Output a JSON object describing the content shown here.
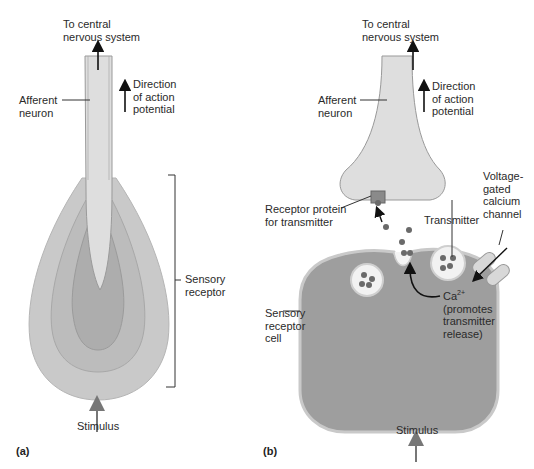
{
  "panel_a": {
    "panel_label": "(a)",
    "to_cns": [
      "To central",
      "nervous system"
    ],
    "afferent": [
      "Afferent",
      "neuron"
    ],
    "direction": [
      "Direction",
      "of action",
      "potential"
    ],
    "sensory_receptor": [
      "Sensory",
      "receptor"
    ],
    "stimulus": "Stimulus"
  },
  "panel_b": {
    "panel_label": "(b)",
    "to_cns": [
      "To central",
      "nervous system"
    ],
    "afferent": [
      "Afferent",
      "neuron"
    ],
    "direction": [
      "Direction",
      "of action",
      "potential"
    ],
    "receptor_protein": [
      "Receptor protein",
      "for transmitter"
    ],
    "voltage_gated": [
      "Voltage-",
      "gated",
      "calcium",
      "channel"
    ],
    "transmitter": "Transmitter",
    "ca_ion": "Ca",
    "ca_charge": "2+",
    "ca_note": [
      "(promotes",
      "transmitter",
      "release)"
    ],
    "sensory_cell": [
      "Sensory",
      "receptor",
      "cell"
    ],
    "stimulus": "Stimulus"
  },
  "colors": {
    "neuron_fill": "#dcdcdc",
    "neuron_edge": "#9a9a9a",
    "layer_outer": "#c8c8c8",
    "layer_mid": "#b9b9b9",
    "layer_inner": "#ababab",
    "cell_fill": "#9d9d9d",
    "dot": "#6e6e6e",
    "stimulus_arrow": "#7a7a7a"
  }
}
